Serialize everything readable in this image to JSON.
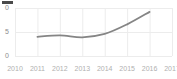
{
  "title_bar": {
    "label": ""
  },
  "chart_data": {
    "type": "line",
    "title": "",
    "subtitle": "",
    "xlabel": "",
    "ylabel": "",
    "grid": true,
    "legend": false,
    "legend_position": "none",
    "line_color": "#858585",
    "gridline_color": "#ececec",
    "axis_label_color": "#b0b0b0",
    "ytick_label_color": "#8c8c8c",
    "background_color": "#ffffff",
    "x": [
      2010,
      2011,
      2012,
      2013,
      2014,
      2015,
      2016,
      2017
    ],
    "xticklabels": [
      "2010",
      "2011",
      "2012",
      "2013",
      "2014",
      "2015",
      "2016",
      "2017"
    ],
    "xlim": [
      2010,
      2017
    ],
    "ylim": [
      0,
      10
    ],
    "yticks": [
      0,
      5,
      10
    ],
    "yticklabels": [
      "0",
      "5",
      "10"
    ],
    "yticklabels_clipped": [
      "0",
      "5",
      "0"
    ],
    "series": [
      {
        "name": "series-1",
        "color": "#858585",
        "x": [
          2011,
          2012,
          2013,
          2014,
          2015,
          2016
        ],
        "values": [
          4.0,
          4.3,
          3.9,
          4.6,
          6.6,
          9.2
        ]
      }
    ]
  }
}
